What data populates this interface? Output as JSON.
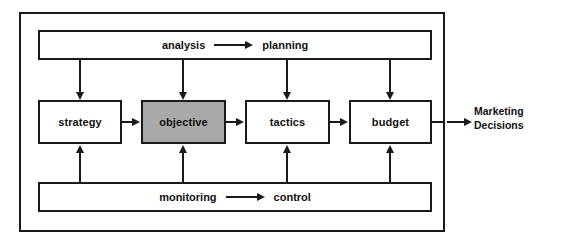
{
  "diagram": {
    "colors": {
      "stroke": "#1a1a1a",
      "box_fill": "#ffffff",
      "highlight_fill": "#a9a9a9",
      "background": "#ffffff",
      "text": "#111111"
    },
    "top_bar": {
      "left_term": "analysis",
      "arrow": "right-arrow",
      "right_term": "planning"
    },
    "bottom_bar": {
      "left_term": "monitoring",
      "arrow": "right-arrow",
      "right_term": "control"
    },
    "nodes": [
      {
        "id": "strategy",
        "label": "strategy",
        "shaded": false
      },
      {
        "id": "objective",
        "label": "objective",
        "shaded": true
      },
      {
        "id": "tactics",
        "label": "tactics",
        "shaded": false
      },
      {
        "id": "budget",
        "label": "budget",
        "shaded": false
      }
    ],
    "output": {
      "line1": "Marketing",
      "line2": "Decisions"
    }
  }
}
